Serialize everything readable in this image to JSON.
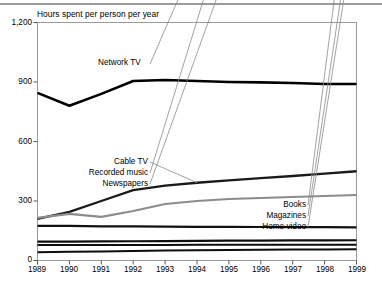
{
  "chart_data": {
    "type": "line",
    "title": "Hours spent per person per year",
    "xlabel": "",
    "ylabel": "",
    "x": [
      1989,
      1990,
      1991,
      1992,
      1993,
      1994,
      1995,
      1996,
      1997,
      1998,
      1999
    ],
    "xtick_labels": [
      "1989",
      "1990",
      "1991",
      "1992",
      "1993",
      "1994",
      "1995",
      "1996",
      "1997",
      "1998",
      "1999"
    ],
    "ytick_labels": [
      "0",
      "300",
      "600",
      "900",
      "1,200"
    ],
    "yticks": [
      0,
      300,
      600,
      900,
      1200
    ],
    "ylim": [
      0,
      1200
    ],
    "xlim": [
      1989,
      1999
    ],
    "grid": false,
    "legend_position": "inline-annotations",
    "series": [
      {
        "name": "Network TV",
        "color": "#000000",
        "width": 2.6,
        "values": [
          845,
          780,
          840,
          905,
          910,
          905,
          900,
          898,
          895,
          890,
          890
        ]
      },
      {
        "name": "Cable TV",
        "color": "#1a1a1a",
        "width": 2.3,
        "values": [
          210,
          245,
          300,
          355,
          378,
          392,
          404,
          415,
          426,
          438,
          450
        ]
      },
      {
        "name": "Recorded music",
        "color": "#8c8c8c",
        "width": 2.1,
        "values": [
          215,
          235,
          220,
          250,
          285,
          300,
          310,
          315,
          320,
          325,
          330
        ]
      },
      {
        "name": "Newspapers",
        "color": "#111111",
        "width": 2.2,
        "values": [
          175,
          175,
          172,
          172,
          171,
          170,
          170,
          169,
          168,
          168,
          167
        ]
      },
      {
        "name": "Books",
        "color": "#0d0d0d",
        "width": 2.2,
        "values": [
          95,
          95,
          96,
          97,
          98,
          99,
          100,
          100,
          101,
          101,
          102
        ]
      },
      {
        "name": "Magazines",
        "color": "#0d0d0d",
        "width": 2.0,
        "values": [
          78,
          78,
          78,
          78,
          78,
          79,
          79,
          79,
          80,
          80,
          80
        ]
      },
      {
        "name": "Home video",
        "color": "#0d0d0d",
        "width": 2.0,
        "values": [
          42,
          44,
          46,
          48,
          50,
          52,
          53,
          54,
          55,
          56,
          57
        ]
      }
    ],
    "annotations": [
      {
        "text": "Network TV",
        "target_series": "Network TV"
      },
      {
        "text": "Cable TV",
        "target_series": "Cable TV"
      },
      {
        "text": "Recorded music",
        "target_series": "Recorded music"
      },
      {
        "text": "Newspapers",
        "target_series": "Newspapers"
      },
      {
        "text": "Books",
        "target_series": "Books"
      },
      {
        "text": "Magazines",
        "target_series": "Magazines"
      },
      {
        "text": "Home video",
        "target_series": "Home video"
      }
    ]
  },
  "labels": {
    "title": "Hours spent per person per year",
    "y0": "0",
    "y300": "300",
    "y600": "600",
    "y900": "900",
    "y1200": "1,200",
    "x1989": "1989",
    "x1990": "1990",
    "x1991": "1991",
    "x1992": "1992",
    "x1993": "1993",
    "x1994": "1994",
    "x1995": "1995",
    "x1996": "1996",
    "x1997": "1997",
    "x1998": "1998",
    "x1999": "1999",
    "s_network_tv": "Network TV",
    "s_cable_tv": "Cable TV",
    "s_recorded_music": "Recorded music",
    "s_newspapers": "Newspapers",
    "s_books": "Books",
    "s_magazines": "Magazines",
    "s_home_video": "Home video"
  }
}
